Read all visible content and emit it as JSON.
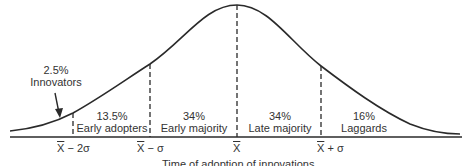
{
  "diagram": {
    "type": "bell-curve",
    "x_axis_caption": "Time of adoption of innovations",
    "line_color": "#2a2a2a",
    "background": "#ffffff",
    "segments": [
      {
        "id": "innovators",
        "percent": "2.5%",
        "label": "Innovators"
      },
      {
        "id": "early-adopters",
        "percent": "13.5%",
        "label": "Early adopters"
      },
      {
        "id": "early-majority",
        "percent": "34%",
        "label": "Early majority"
      },
      {
        "id": "late-majority",
        "percent": "34%",
        "label": "Late majority"
      },
      {
        "id": "laggards",
        "percent": "16%",
        "label": "Laggards"
      }
    ],
    "ticks": [
      {
        "id": "mean-minus-2sd",
        "symbol": "X",
        "suffix": " − 2σ"
      },
      {
        "id": "mean-minus-sd",
        "symbol": "X",
        "suffix": " − σ"
      },
      {
        "id": "mean",
        "symbol": "X",
        "suffix": ""
      },
      {
        "id": "mean-plus-sd",
        "symbol": "X",
        "suffix": " + σ"
      }
    ]
  }
}
